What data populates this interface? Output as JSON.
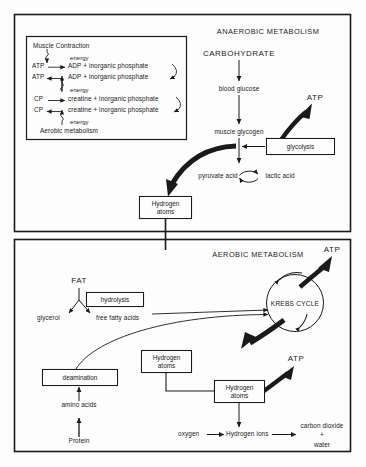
{
  "figure": {
    "background": "#fdfdfd",
    "ink": "#1a1a1a"
  },
  "anaerobic_panel": {
    "title": "ANAEROBIC METABOLISM",
    "muscle_box": {
      "header": "Muscle Contraction",
      "footer": "Aerobic metabolism",
      "energy_1": "energy",
      "energy_2": "energy",
      "energy_3": "energy",
      "row1_left": "ATP",
      "row1_right": "ADP + inorganic phosphate",
      "row2_left": "ATP",
      "row2_right": "ADP + inorganic phosphate",
      "row3_left": "CP",
      "row3_right": "creatine + inorganic phosphate",
      "row4_left": "CP",
      "row4_right": "creatine + inorganic phosphate"
    },
    "chain": {
      "carbohydrate": "CARBOHYDRATE",
      "blood_glucose": "blood glucose",
      "muscle_glycogen": "muscle glycogen",
      "pyruvate_acid": "pyruvate acid",
      "lactic_acid": "lactic acid",
      "glycolysis": "glycolysis",
      "atp": "ATP"
    },
    "hydrogen_atoms": "Hydrogen\natoms"
  },
  "aerobic_panel": {
    "title": "AEROBIC METABOLISM",
    "fat": "FAT",
    "hydrolysis": "hydrolysis",
    "glycerol": "glycerol",
    "free_fatty_acids": "free fatty acids",
    "deamination": "deamination",
    "amino_acids": "amino acids",
    "protein": "Protein",
    "krebs_cycle": "KREBS CYCLE",
    "atp_top": "ATP",
    "atp_lower": "ATP",
    "hydrogen_atoms_1": "Hydrogen\natoms",
    "hydrogen_atoms_2": "Hydrogen\natoms",
    "oxygen": "oxygen",
    "hydrogen_ions": "Hydrogen ions",
    "carbon_dioxide": "carbon dioxide",
    "plus": "+",
    "water": "water"
  }
}
